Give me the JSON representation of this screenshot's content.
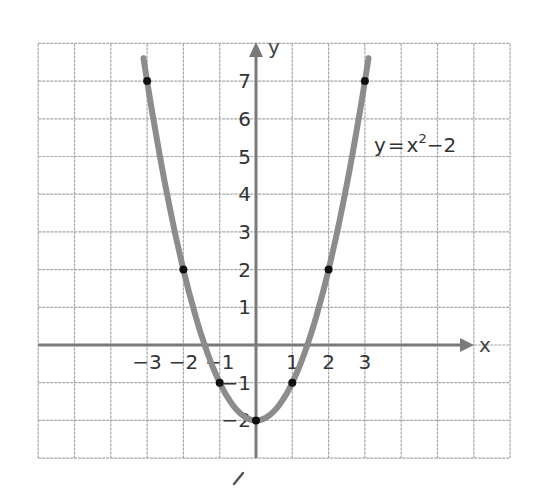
{
  "chart_data": {
    "type": "line",
    "title": "",
    "equation_label": {
      "y": "y",
      "eq": "=",
      "x": "x",
      "exp": "2",
      "rest": "−2"
    },
    "xlabel": "x",
    "ylabel": "y",
    "xlim": [
      -6,
      7
    ],
    "ylim": [
      -3,
      8
    ],
    "grid": true,
    "x_tick_labels": [
      "−3",
      "−2",
      "−1",
      "1",
      "2",
      "3"
    ],
    "x_ticks": [
      -3,
      -2,
      -1,
      1,
      2,
      3
    ],
    "y_tick_labels": [
      "7",
      "6",
      "5",
      "4",
      "3",
      "2",
      "1",
      "−1",
      "−2"
    ],
    "y_ticks": [
      7,
      6,
      5,
      4,
      3,
      2,
      1,
      -1,
      -2
    ],
    "series": [
      {
        "name": "y=x^2-2",
        "function": "x^2 - 2",
        "x_range": [
          -3.1,
          3.1
        ],
        "color": "#8c8c8c"
      }
    ],
    "points": [
      {
        "x": -3,
        "y": 7
      },
      {
        "x": -2,
        "y": 2
      },
      {
        "x": -1,
        "y": -1
      },
      {
        "x": 0,
        "y": -2
      },
      {
        "x": 1,
        "y": -1
      },
      {
        "x": 2,
        "y": 2
      },
      {
        "x": 3,
        "y": 7
      }
    ],
    "colors": {
      "grid": "#a6a6a6",
      "axis": "#7a7a7a",
      "curve": "#8c8c8c",
      "point": "#111111",
      "text": "#333333"
    }
  }
}
